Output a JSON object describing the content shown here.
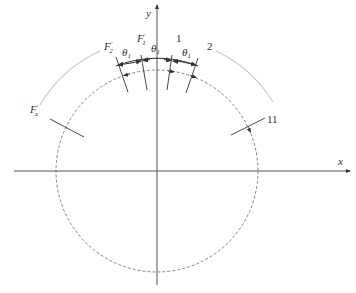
{
  "diagram": {
    "type": "geometric-schematic",
    "center": {
      "x": 157,
      "y": 171
    },
    "axes": {
      "x_label": "x",
      "y_label": "y",
      "axis_color": "#555555"
    },
    "circles": {
      "dashed_radius": 101,
      "solid_arc_radius": 112,
      "outer_grey_arc_radius": 134,
      "dashed_color": "#777777",
      "solid_color": "#333333",
      "grey_arc_color": "#cccccc"
    },
    "angles": {
      "symbol": "θ",
      "subscript": "1",
      "count": 3
    },
    "labels": {
      "f1_main": "F",
      "f1_prime": "′",
      "f1_sub": "1",
      "f2_main": "F",
      "f2_prime": "′",
      "f2_sub": "2",
      "fz_main": "F",
      "fz_prime": "′",
      "fz_sub": "z",
      "label_1": "1",
      "label_2": "2",
      "label_11": "11"
    }
  }
}
